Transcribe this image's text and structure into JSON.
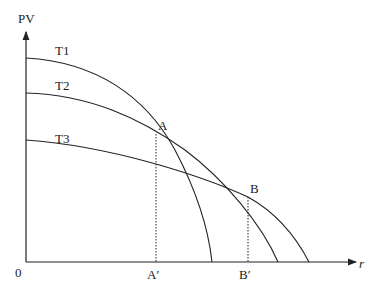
{
  "diagram": {
    "axes": {
      "y_label": "PV",
      "x_label": "r",
      "origin_label": "0"
    },
    "curves": [
      {
        "name": "T1",
        "label": "T1"
      },
      {
        "name": "T2",
        "label": "T2"
      },
      {
        "name": "T3",
        "label": "T3"
      }
    ],
    "points": [
      {
        "name": "A",
        "label": "A",
        "projection_label": "A′"
      },
      {
        "name": "B",
        "label": "B",
        "projection_label": "B′"
      }
    ],
    "colors": {
      "line": "#222222",
      "background": "#ffffff"
    }
  }
}
